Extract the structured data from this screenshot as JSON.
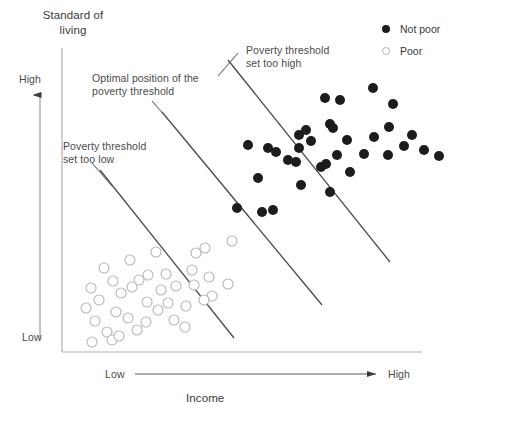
{
  "axes": {
    "y_title": "Standard of\nliving",
    "y_high": "High",
    "y_low": "Low",
    "x_title": "Income",
    "x_low": "Low",
    "x_high": "High"
  },
  "annotations": {
    "optimal": "Optimal position of the\npoverty threshold",
    "too_low": "Poverty threshold\nset too low",
    "too_high": "Poverty threshold\nset too high"
  },
  "legend": {
    "items": [
      {
        "label": "Not poor",
        "marker": "filled-circle-icon",
        "color": "#1c1c1c"
      },
      {
        "label": "Poor",
        "marker": "open-circle-icon",
        "color": "#b6b6b6"
      }
    ]
  },
  "chart_data": {
    "type": "scatter",
    "title": "",
    "xlabel": "Income",
    "ylabel": "Standard of living",
    "xlim": [
      0,
      100
    ],
    "ylim": [
      0,
      100
    ],
    "grid": false,
    "legend_position": "top-right",
    "xtick_labels": [
      "Low",
      "High"
    ],
    "ytick_labels": [
      "Low",
      "High"
    ],
    "axis_style": "arrow-qualitative",
    "frame": {
      "x0": 62,
      "y0": 48,
      "x1": 422,
      "y1": 352
    },
    "series": [
      {
        "name": "Not poor",
        "marker": "filled-circle",
        "color": "#1c1c1c",
        "radius": 5,
        "points": [
          [
            373,
            88
          ],
          [
            325,
            98
          ],
          [
            340,
            100
          ],
          [
            393,
            104
          ],
          [
            330,
            124
          ],
          [
            333,
            128
          ],
          [
            306,
            130
          ],
          [
            389,
            127
          ],
          [
            299,
            135
          ],
          [
            311,
            141
          ],
          [
            374,
            137
          ],
          [
            412,
            135
          ],
          [
            248,
            145
          ],
          [
            299,
            148
          ],
          [
            347,
            140
          ],
          [
            404,
            146
          ],
          [
            268,
            148
          ],
          [
            276,
            152
          ],
          [
            364,
            154
          ],
          [
            424,
            150
          ],
          [
            337,
            155
          ],
          [
            388,
            155
          ],
          [
            288,
            160
          ],
          [
            296,
            162
          ],
          [
            326,
            164
          ],
          [
            321,
            167
          ],
          [
            439,
            156
          ],
          [
            350,
            172
          ],
          [
            258,
            178
          ],
          [
            301,
            185
          ],
          [
            237,
            208
          ],
          [
            262,
            212
          ],
          [
            273,
            210
          ],
          [
            330,
            192
          ]
        ]
      },
      {
        "name": "Poor",
        "marker": "open-circle",
        "color": "#b6b6b6",
        "radius": 5,
        "points": [
          [
            232,
            241
          ],
          [
            205,
            248
          ],
          [
            156,
            252
          ],
          [
            196,
            253
          ],
          [
            130,
            260
          ],
          [
            104,
            268
          ],
          [
            148,
            275
          ],
          [
            166,
            274
          ],
          [
            113,
            281
          ],
          [
            139,
            280
          ],
          [
            192,
            270
          ],
          [
            209,
            277
          ],
          [
            91,
            288
          ],
          [
            132,
            287
          ],
          [
            194,
            285
          ],
          [
            228,
            284
          ],
          [
            121,
            293
          ],
          [
            161,
            290
          ],
          [
            176,
            286
          ],
          [
            212,
            296
          ],
          [
            99,
            300
          ],
          [
            147,
            302
          ],
          [
            168,
            303
          ],
          [
            204,
            300
          ],
          [
            86,
            308
          ],
          [
            116,
            312
          ],
          [
            158,
            310
          ],
          [
            186,
            306
          ],
          [
            95,
            321
          ],
          [
            128,
            318
          ],
          [
            146,
            322
          ],
          [
            174,
            320
          ],
          [
            107,
            332
          ],
          [
            137,
            330
          ],
          [
            185,
            327
          ],
          [
            92,
            342
          ],
          [
            112,
            340
          ],
          [
            119,
            336
          ]
        ]
      }
    ],
    "threshold_lines": [
      {
        "name": "set too low",
        "x1": 100,
        "y1": 170,
        "x2": 234,
        "y2": 338,
        "color": "#4a4a4a"
      },
      {
        "name": "optimal position",
        "x1": 162,
        "y1": 112,
        "x2": 322,
        "y2": 305,
        "color": "#4a4a4a"
      },
      {
        "name": "set too high",
        "x1": 228,
        "y1": 60,
        "x2": 390,
        "y2": 262,
        "color": "#4a4a4a"
      }
    ],
    "leader_lines": [
      {
        "name": "optimal-leader",
        "x1": 152,
        "y1": 101,
        "x2": 172,
        "y2": 124
      },
      {
        "name": "too-low-leader",
        "x1": 92,
        "y1": 163,
        "x2": 112,
        "y2": 186
      },
      {
        "name": "too-high-leader",
        "x1": 238,
        "y1": 53,
        "x2": 218,
        "y2": 76
      }
    ]
  }
}
